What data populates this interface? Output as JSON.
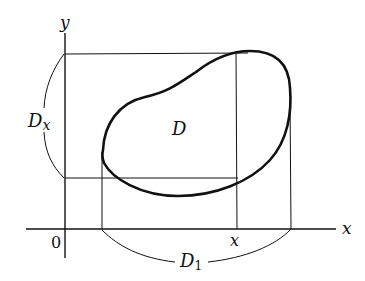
{
  "diagram": {
    "type": "region-projection",
    "labels": {
      "y_axis": "y",
      "x_axis": "x",
      "origin": "0",
      "region": "D",
      "x_tick": "x",
      "y_projection_main": "D",
      "y_projection_sub": "x",
      "x_projection_main": "D",
      "x_projection_sub": "1"
    },
    "colors": {
      "ink": "#111111",
      "background": "#ffffff"
    }
  }
}
